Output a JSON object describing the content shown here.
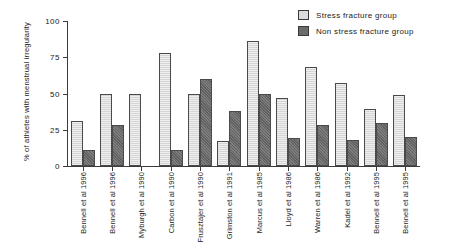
{
  "chart_data": {
    "type": "bar",
    "title": "",
    "xlabel": "",
    "ylabel": "% of athletes with menstrual irregularity",
    "ylim": [
      0,
      100
    ],
    "yticks": [
      "0",
      "25",
      "50",
      "75",
      "100"
    ],
    "grid": false,
    "legend_position": "top-right",
    "categories": [
      "Bennell et al 1996",
      "Bennell et al 1996",
      "Myburgh et al 1990",
      "Carbon et al 1990",
      "Frusztajer et al 1990",
      "Grimston et al 1991",
      "Marcus et al 1985",
      "Lloyd et al 1986",
      "Warren et al 1986",
      "Kadel et al 1992",
      "Bennell et al 1995",
      "Bennell et al 1995"
    ],
    "series": [
      {
        "name": "Stress fracture group",
        "color": "#dcdcdc",
        "values": [
          31,
          50,
          50,
          78,
          50,
          17,
          86,
          47,
          68,
          57,
          39,
          49
        ]
      },
      {
        "name": "Non stress fracture group",
        "color": "#6b6b6b",
        "values": [
          11,
          28,
          0,
          11,
          60,
          38,
          50,
          19,
          28,
          18,
          30,
          20
        ]
      }
    ]
  },
  "legend": {
    "items": [
      {
        "label": "Stress fracture group",
        "swatch": "light"
      },
      {
        "label": "Non stress fracture group",
        "swatch": "dark"
      }
    ]
  }
}
